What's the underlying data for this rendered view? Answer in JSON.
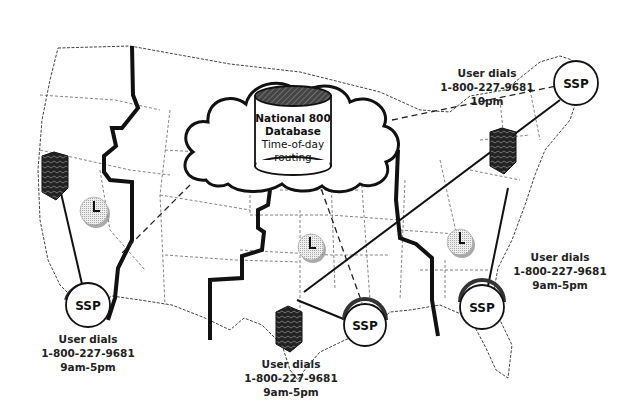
{
  "diagram": {
    "database": {
      "line1": "National 800",
      "line2": "Database",
      "line3": "Time-of-day",
      "line4": "routing"
    },
    "ssp_nodes": [
      {
        "id": "west",
        "label": "SSP"
      },
      {
        "id": "northeast",
        "label": "SSP"
      },
      {
        "id": "south-central",
        "label": "SSP"
      },
      {
        "id": "southeast",
        "label": "SSP"
      }
    ],
    "callouts": [
      {
        "id": "west",
        "line1": "User dials",
        "line2": "1-800-227-9681",
        "line3": "9am-5pm"
      },
      {
        "id": "northeast",
        "line1": "User dials",
        "line2": "1-800-227-9681",
        "line3": "10pm"
      },
      {
        "id": "central",
        "line1": "User dials",
        "line2": "1-800-227-9681",
        "line3": "9am-5pm"
      },
      {
        "id": "east",
        "line1": "User dials",
        "line2": "1-800-227-9681",
        "line3": "9am-5pm"
      }
    ],
    "icons": {
      "clock": "clock-icon",
      "building": "office-building-icon",
      "database": "database-cylinder-icon",
      "cloud": "network-cloud-icon"
    },
    "colors": {
      "ink": "#111111",
      "clock_fill": "#d8d8d8",
      "background": "#ffffff"
    }
  }
}
